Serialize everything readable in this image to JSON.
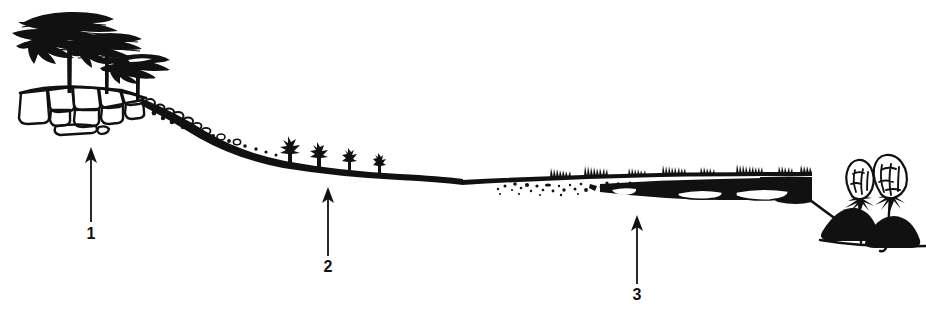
{
  "figure": {
    "type": "cross-section-profile",
    "width": 926,
    "height": 317,
    "background_color": "#ffffff",
    "ink_color": "#111111",
    "style": "black-and-white pen-and-ink line drawing"
  },
  "annotations": {
    "markers": [
      {
        "label": "1",
        "name": "upper-slope-marker",
        "arrow_x": 91,
        "arrow_tip_y": 148,
        "arrow_tail_y": 222,
        "label_x": 91,
        "label_y": 239,
        "points_to": "rocky outcrop with umbrella trees"
      },
      {
        "label": "2",
        "name": "mid-slope-marker",
        "arrow_x": 328,
        "arrow_tip_y": 188,
        "arrow_tail_y": 256,
        "label_x": 328,
        "label_y": 272,
        "points_to": "mid slope with small shrubs"
      },
      {
        "label": "3",
        "name": "valley-floor-marker",
        "arrow_x": 637,
        "arrow_tip_y": 215,
        "arrow_tail_y": 284,
        "label_x": 637,
        "label_y": 300,
        "points_to": "valley floor with dark soil and grasses"
      }
    ]
  },
  "scene": {
    "zones": [
      {
        "name": "rocky-outcrop",
        "description": "Boulder field / rock outcrop on the crest at upper left",
        "x_range": [
          18,
          150
        ],
        "y_range": [
          78,
          125
        ]
      },
      {
        "name": "umbrella-trees",
        "description": "Three flat-crowned umbrella (acacia-like) trees on the crest, decreasing in size left to right",
        "trees": [
          {
            "name": "tree-large",
            "trunk_x": 70,
            "crown_cy": 33,
            "crown_rx": 46,
            "crown_ry": 14,
            "base_y": 92
          },
          {
            "name": "tree-medium",
            "trunk_x": 107,
            "crown_cy": 48,
            "crown_rx": 33,
            "crown_ry": 11,
            "base_y": 92
          },
          {
            "name": "tree-small",
            "trunk_x": 138,
            "crown_cy": 66,
            "crown_rx": 28,
            "crown_ry": 10,
            "base_y": 100
          }
        ]
      },
      {
        "name": "pebble-scree",
        "description": "Loose pebbles and small stones scattered along the steep upper slope",
        "x_range": [
          140,
          240
        ]
      },
      {
        "name": "mid-slope-shrubs",
        "description": "Four small spiky shrubs standing on the dark mid-slope band, decreasing in size left to right",
        "shrubs": [
          {
            "name": "shrub-1",
            "x": 289,
            "height": 28
          },
          {
            "name": "shrub-2",
            "x": 318,
            "height": 24
          },
          {
            "name": "shrub-3",
            "x": 349,
            "height": 20
          },
          {
            "name": "shrub-4",
            "x": 379,
            "height": 17
          }
        ]
      },
      {
        "name": "stipple-texture",
        "description": "Stippled dots beneath the ground line indicating sandy/alluvial deposit on the valley floor",
        "x_range": [
          495,
          640
        ]
      },
      {
        "name": "grass-tufts",
        "description": "Rows of short grass tufts standing on the valley floor ground line",
        "x_range": [
          545,
          830
        ]
      },
      {
        "name": "dark-soil-band",
        "description": "Thick black soil horizon thickening to the right, with white lens-shaped pockets inside",
        "x_range": [
          600,
          812
        ]
      },
      {
        "name": "right-bushes",
        "description": "Two outlined leafy bushes on thin stems with black earth mounds at their bases, at the right edge",
        "bushes": [
          {
            "name": "bush-left",
            "stem_x": 861,
            "top_y": 168
          },
          {
            "name": "bush-right",
            "stem_x": 891,
            "top_y": 163
          }
        ]
      }
    ]
  }
}
